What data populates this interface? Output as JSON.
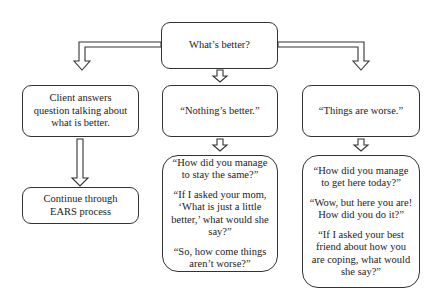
{
  "diagram": {
    "top": {
      "label": "What’s better?"
    },
    "left": {
      "answer": "Client answers question talking about what is better.",
      "next": "Continue through EARS process"
    },
    "middle": {
      "answer": "“Nothing’s better.”",
      "questions": [
        "“How did you manage to stay the same?”",
        "“If I asked your mom, ‘What is just a little better,’ what would she say?”",
        "“So, how come things aren’t worse?”"
      ]
    },
    "right": {
      "answer": "“Things are worse.”",
      "questions": [
        "“How did you manage to get here today?”",
        "“Wow, but here you are! How did you do it?”",
        "“If I asked your best friend about how you are coping, what would she say?”"
      ]
    }
  }
}
